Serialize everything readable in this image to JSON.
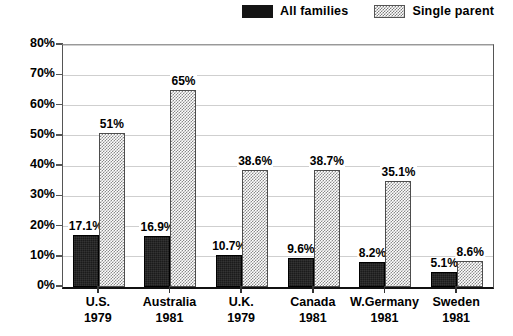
{
  "legend": {
    "entries": [
      {
        "label": "All families",
        "swatch": "solid-black-swatch",
        "color": "#141414"
      },
      {
        "label": "Single parent",
        "swatch": "hatched-gray-swatch",
        "color": "#8a8a8a"
      }
    ]
  },
  "yaxis": {
    "ticks": [
      "0%",
      "10%",
      "20%",
      "30%",
      "40%",
      "50%",
      "60%",
      "70%",
      "80%"
    ]
  },
  "chart_data": {
    "type": "bar",
    "title": "",
    "subtitle": "",
    "xlabel": "",
    "ylabel": "",
    "ylim": [
      0,
      80
    ],
    "ytick_step": 10,
    "ytick_format": "percent",
    "grid": true,
    "legend_position": "top-right",
    "categories": [
      "U.S.",
      "Australia",
      "U.K.",
      "Canada",
      "W.Germany",
      "Sweden"
    ],
    "category_years": [
      "1979",
      "1981",
      "1979",
      "1981",
      "1981",
      "1981"
    ],
    "series": [
      {
        "name": "All families",
        "values": [
          17.1,
          16.9,
          10.7,
          9.6,
          8.2,
          5.1
        ],
        "labels": [
          "17.1%",
          "16.9%",
          "10.7%",
          "9.6%",
          "8.2%",
          "5.1%"
        ]
      },
      {
        "name": "Single parent",
        "values": [
          51,
          65,
          38.6,
          38.7,
          35.1,
          8.6
        ],
        "labels": [
          "51%",
          "65%",
          "38.6%",
          "38.7%",
          "35.1%",
          "8.6%"
        ]
      }
    ]
  }
}
